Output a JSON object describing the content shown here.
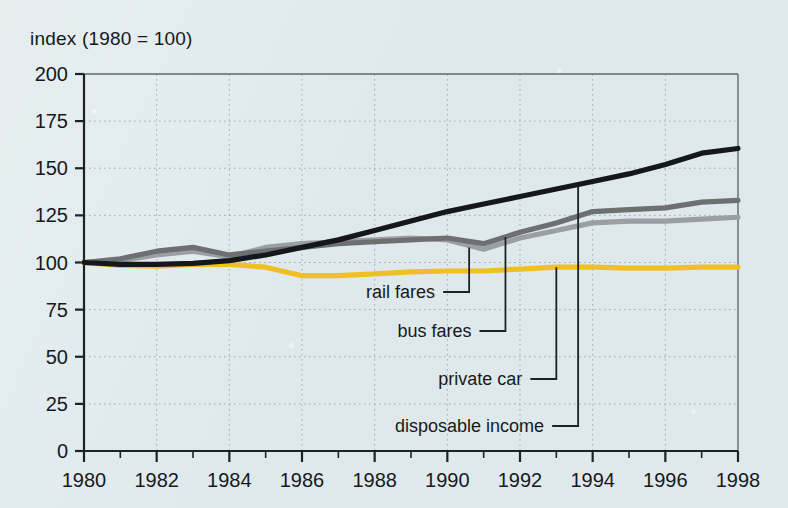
{
  "figure": {
    "axis_title": "index (1980 = 100)",
    "background_color": "#dfe9ec",
    "frame_color": "#5a6a70",
    "grid_color": "#8ea3ab"
  },
  "chart_data": {
    "type": "line",
    "title": "index (1980 = 100)",
    "xlabel": "",
    "ylabel": "index (1980 = 100)",
    "xlim": [
      1980,
      1998
    ],
    "ylim": [
      0,
      200
    ],
    "yticks": [
      0,
      25,
      50,
      75,
      100,
      125,
      150,
      175,
      200
    ],
    "xticks": [
      1980,
      1982,
      1984,
      1986,
      1988,
      1990,
      1992,
      1994,
      1996,
      1998
    ],
    "xtick_labels": [
      "1980",
      "1982",
      "1984",
      "1986",
      "1988",
      "1990",
      "1992",
      "1994",
      "1996",
      "1998"
    ],
    "ytick_labels": [
      "0",
      "25",
      "50",
      "75",
      "100",
      "125",
      "150",
      "175",
      "200"
    ],
    "minor_xticks_every": 1,
    "grid": true,
    "grid_style": "dotted",
    "legend_position": "inline-callouts",
    "x": [
      1980,
      1981,
      1982,
      1983,
      1984,
      1985,
      1986,
      1987,
      1988,
      1989,
      1990,
      1991,
      1992,
      1993,
      1994,
      1995,
      1996,
      1997,
      1998
    ],
    "series": [
      {
        "name": "disposable income",
        "color": "#15181b",
        "values": [
          100,
          99,
          99,
          99.5,
          101,
          104,
          108,
          112,
          117,
          122,
          127,
          131,
          135,
          139,
          143,
          147,
          152,
          158,
          160.5
        ]
      },
      {
        "name": "bus fares",
        "color": "#6d6f70",
        "values": [
          100,
          102,
          106,
          108,
          104,
          106,
          108,
          110,
          111,
          112,
          113,
          110,
          116,
          121,
          127,
          128,
          129,
          132,
          133
        ]
      },
      {
        "name": "rail fares",
        "color": "#9aa0a2",
        "values": [
          100,
          101,
          104,
          106,
          103,
          108,
          110,
          111,
          112,
          113,
          112,
          107,
          113,
          117,
          121,
          122,
          122,
          123,
          124
        ]
      },
      {
        "name": "private car",
        "color": "#efc025",
        "values": [
          100,
          98.5,
          98,
          99,
          99,
          97.5,
          93,
          93,
          94,
          95,
          95.5,
          95.5,
          96.5,
          97.5,
          97.5,
          97,
          97,
          97.5,
          97.5
        ]
      }
    ],
    "callouts": [
      {
        "label": "rail fares",
        "series": "rail fares",
        "anchor_year": 1990.6,
        "anchor_value": 108
      },
      {
        "label": "bus fares",
        "series": "bus fares",
        "anchor_year": 1991.6,
        "anchor_value": 113.5
      },
      {
        "label": "private car",
        "series": "private car",
        "anchor_year": 1993.0,
        "anchor_value": 97.5
      },
      {
        "label": "disposable income",
        "series": "disposable income",
        "anchor_year": 1993.6,
        "anchor_value": 140
      }
    ]
  }
}
